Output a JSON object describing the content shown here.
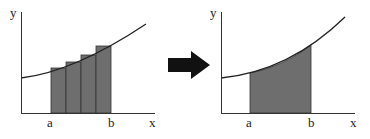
{
  "left_panel": {
    "y_label": "y",
    "x_label": "x",
    "a_label": "a",
    "b_label": "b",
    "rectangles": 4,
    "description": "Riemann sum approximation with 4 rectangles under curve from a to b"
  },
  "arrow": {
    "icon": "right-arrow-icon",
    "color": "#111111"
  },
  "right_panel": {
    "y_label": "y",
    "x_label": "x",
    "a_label": "a",
    "b_label": "b",
    "description": "Exact area under curve from a to b"
  },
  "colors": {
    "fill": "#6e6e6e",
    "line": "#222222",
    "axis": "#333333"
  }
}
